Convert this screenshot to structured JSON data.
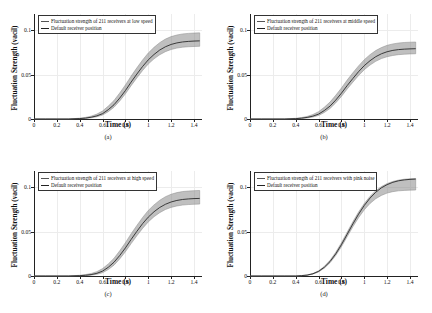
{
  "figure": {
    "panels": [
      {
        "id": "a",
        "caption": "(a)",
        "legend": [
          "Fluctuation strength of 211 receivers at low speed",
          "Default receiver position"
        ],
        "xlabel": "Time (s)",
        "ylabel": "Fluctuation Strength (vacil)"
      },
      {
        "id": "b",
        "caption": "(b)",
        "legend": [
          "Fluctuation strength of 211 receivers at middle speed",
          "Default receiver position"
        ],
        "xlabel": "Time (s)",
        "ylabel": "Fluctuation Strength (vacil)"
      },
      {
        "id": "c",
        "caption": "(c)",
        "legend": [
          "Fluctuation strength of 211 receivers at high speed",
          "Default receiver position"
        ],
        "xlabel": "Time (s)",
        "ylabel": "Fluctuation Strength (vacil)"
      },
      {
        "id": "d",
        "caption": "(d)",
        "legend": [
          "Fluctuation strength of 211 receivers with pink noise",
          "Default receiver position"
        ],
        "xlabel": "Time (s)",
        "ylabel": "Fluctuation Strength (vacil)"
      }
    ]
  },
  "chart_data": [
    {
      "type": "line",
      "panel": "a",
      "title": "",
      "xlabel": "Time (s)",
      "ylabel": "Fluctuation Strength (vacil)",
      "xlim": [
        0,
        1.47
      ],
      "ylim": [
        0,
        0.118
      ],
      "xticks": [
        0,
        0.2,
        0.4,
        0.6,
        0.8,
        1,
        1.2,
        1.4
      ],
      "xticklabels": [
        "0",
        "0.2",
        "0.4",
        "0.6",
        "0.8",
        "1",
        "1.2",
        "1.4"
      ],
      "yticks": [
        0,
        0.05,
        0.1
      ],
      "yticklabels": [
        "0",
        "0.05",
        "0.1"
      ],
      "grid": true,
      "legend_position": "upper-left",
      "x": [
        0,
        0.1,
        0.2,
        0.3,
        0.4,
        0.45,
        0.5,
        0.55,
        0.6,
        0.65,
        0.7,
        0.75,
        0.8,
        0.85,
        0.9,
        0.95,
        1.0,
        1.05,
        1.1,
        1.15,
        1.2,
        1.25,
        1.3,
        1.35,
        1.4,
        1.45
      ],
      "series": [
        {
          "name": "Default receiver position",
          "color": "#222222",
          "values": [
            0,
            0,
            0,
            0,
            0.0005,
            0.001,
            0.002,
            0.0035,
            0.006,
            0.0105,
            0.016,
            0.0235,
            0.032,
            0.0415,
            0.0505,
            0.059,
            0.0665,
            0.0725,
            0.0775,
            0.0812,
            0.0838,
            0.0855,
            0.0866,
            0.0872,
            0.0876,
            0.0878
          ]
        },
        {
          "name": "Fluctuation strength of 211 receivers at low speed (band upper)",
          "color": "#8a8a8a",
          "values": [
            0,
            0,
            0,
            0,
            0.0009,
            0.0018,
            0.0032,
            0.0055,
            0.009,
            0.0145,
            0.0208,
            0.0292,
            0.0383,
            0.0482,
            0.0575,
            0.0663,
            0.0742,
            0.0805,
            0.0858,
            0.0898,
            0.0926,
            0.0944,
            0.0956,
            0.0962,
            0.0966,
            0.0968
          ]
        },
        {
          "name": "Fluctuation strength of 211 receivers at low speed (band lower)",
          "color": "#8a8a8a",
          "values": [
            0,
            0,
            0,
            0,
            0.0003,
            0.0006,
            0.0013,
            0.0025,
            0.0045,
            0.0082,
            0.0132,
            0.0202,
            0.0283,
            0.0375,
            0.0462,
            0.0545,
            0.0618,
            0.0676,
            0.0722,
            0.0757,
            0.0781,
            0.0797,
            0.0807,
            0.0812,
            0.0815,
            0.0817
          ]
        }
      ]
    },
    {
      "type": "line",
      "panel": "b",
      "title": "",
      "xlabel": "Time (s)",
      "ylabel": "Fluctuation Strength (vacil)",
      "xlim": [
        0,
        1.47
      ],
      "ylim": [
        0,
        0.118
      ],
      "xticks": [
        0,
        0.2,
        0.4,
        0.6,
        0.8,
        1,
        1.2,
        1.4
      ],
      "xticklabels": [
        "0",
        "0.2",
        "0.4",
        "0.6",
        "0.8",
        "1",
        "1.2",
        "1.4"
      ],
      "yticks": [
        0,
        0.05,
        0.1
      ],
      "yticklabels": [
        "0",
        "0.05",
        "0.1"
      ],
      "grid": true,
      "legend_position": "upper-left",
      "x": [
        0,
        0.1,
        0.2,
        0.3,
        0.4,
        0.45,
        0.5,
        0.55,
        0.6,
        0.65,
        0.7,
        0.75,
        0.8,
        0.85,
        0.9,
        0.95,
        1.0,
        1.05,
        1.1,
        1.15,
        1.2,
        1.25,
        1.3,
        1.35,
        1.4,
        1.45
      ],
      "series": [
        {
          "name": "Default receiver position",
          "color": "#222222",
          "values": [
            0,
            0,
            0,
            0,
            0.0004,
            0.0009,
            0.0018,
            0.0032,
            0.0055,
            0.0095,
            0.0145,
            0.0212,
            0.029,
            0.0375,
            0.0455,
            0.0532,
            0.06,
            0.0655,
            0.07,
            0.0733,
            0.0756,
            0.0771,
            0.078,
            0.0785,
            0.0788,
            0.079
          ]
        },
        {
          "name": "Fluctuation strength of 211 receivers at middle speed (band upper)",
          "color": "#8a8a8a",
          "values": [
            0,
            0,
            0,
            0,
            0.0008,
            0.0016,
            0.0029,
            0.005,
            0.0082,
            0.0132,
            0.019,
            0.0266,
            0.0348,
            0.0437,
            0.0519,
            0.0597,
            0.0667,
            0.0723,
            0.0769,
            0.0803,
            0.0828,
            0.0844,
            0.0854,
            0.086,
            0.0863,
            0.0865
          ]
        },
        {
          "name": "Fluctuation strength of 211 receivers at middle speed (band lower)",
          "color": "#8a8a8a",
          "values": [
            0,
            0,
            0,
            0,
            0.0002,
            0.0005,
            0.0011,
            0.0022,
            0.004,
            0.0073,
            0.0118,
            0.0181,
            0.0254,
            0.0336,
            0.0414,
            0.0488,
            0.0554,
            0.0606,
            0.0648,
            0.0679,
            0.07,
            0.0714,
            0.0723,
            0.0728,
            0.0731,
            0.0733
          ]
        }
      ]
    },
    {
      "type": "line",
      "panel": "c",
      "title": "",
      "xlabel": "Time (s)",
      "ylabel": "Fluctuation Strength (vacil)",
      "xlim": [
        0,
        1.47
      ],
      "ylim": [
        0,
        0.118
      ],
      "xticks": [
        0,
        0.2,
        0.4,
        0.6,
        0.8,
        1,
        1.2,
        1.4
      ],
      "xticklabels": [
        "0",
        "0.2",
        "0.4",
        "0.6",
        "0.8",
        "1",
        "1.2",
        "1.4"
      ],
      "yticks": [
        0,
        0.05,
        0.1
      ],
      "yticklabels": [
        "0",
        "0.05",
        "0.1"
      ],
      "grid": true,
      "legend_position": "upper-left",
      "x": [
        0,
        0.1,
        0.2,
        0.3,
        0.4,
        0.45,
        0.5,
        0.55,
        0.6,
        0.65,
        0.7,
        0.75,
        0.8,
        0.85,
        0.9,
        0.95,
        1.0,
        1.05,
        1.1,
        1.15,
        1.2,
        1.25,
        1.3,
        1.35,
        1.4,
        1.45
      ],
      "series": [
        {
          "name": "Default receiver position",
          "color": "#222222",
          "values": [
            0,
            0,
            0,
            0,
            0.0004,
            0.0008,
            0.0016,
            0.003,
            0.0055,
            0.0098,
            0.0155,
            0.023,
            0.0316,
            0.0411,
            0.0502,
            0.0588,
            0.0662,
            0.0722,
            0.077,
            0.0806,
            0.0832,
            0.0849,
            0.086,
            0.0866,
            0.087,
            0.0872
          ]
        },
        {
          "name": "Fluctuation strength of 211 receivers at high speed (band upper)",
          "color": "#8a8a8a",
          "values": [
            0,
            0,
            0,
            0,
            0.0008,
            0.0016,
            0.0028,
            0.0049,
            0.0083,
            0.0136,
            0.0199,
            0.0283,
            0.0375,
            0.0475,
            0.0568,
            0.0657,
            0.0737,
            0.0799,
            0.0851,
            0.0891,
            0.0919,
            0.0937,
            0.0949,
            0.0955,
            0.0959,
            0.0961
          ]
        },
        {
          "name": "Fluctuation strength of 211 receivers at high speed (band lower)",
          "color": "#8a8a8a",
          "values": [
            0,
            0,
            0,
            0,
            0.0002,
            0.0004,
            0.0009,
            0.0019,
            0.0037,
            0.0072,
            0.0122,
            0.0192,
            0.0273,
            0.0364,
            0.0452,
            0.0535,
            0.0608,
            0.0666,
            0.0712,
            0.0747,
            0.0771,
            0.0787,
            0.0797,
            0.0803,
            0.0806,
            0.0808
          ]
        }
      ]
    },
    {
      "type": "line",
      "panel": "d",
      "title": "",
      "xlabel": "Time (s)",
      "ylabel": "Fluctuation Strength (vacil)",
      "xlim": [
        0,
        1.47
      ],
      "ylim": [
        0,
        0.118
      ],
      "xticks": [
        0,
        0.2,
        0.4,
        0.6,
        0.8,
        1,
        1.2,
        1.4
      ],
      "xticklabels": [
        "0",
        "0.2",
        "0.4",
        "0.6",
        "0.8",
        "1",
        "1.2",
        "1.4"
      ],
      "yticks": [
        0,
        0.05,
        0.1
      ],
      "yticklabels": [
        "0",
        "0.05",
        "0.1"
      ],
      "grid": true,
      "legend_position": "upper-left",
      "x": [
        0,
        0.1,
        0.2,
        0.3,
        0.4,
        0.45,
        0.5,
        0.55,
        0.6,
        0.65,
        0.7,
        0.75,
        0.8,
        0.85,
        0.9,
        0.95,
        1.0,
        1.05,
        1.1,
        1.15,
        1.2,
        1.25,
        1.3,
        1.35,
        1.4,
        1.45
      ],
      "series": [
        {
          "name": "Default receiver position",
          "color": "#222222",
          "values": [
            0,
            0,
            0,
            0,
            0,
            0.0004,
            0.001,
            0.0025,
            0.0052,
            0.0098,
            0.0162,
            0.0248,
            0.0352,
            0.0468,
            0.0585,
            0.0695,
            0.0793,
            0.0875,
            0.0941,
            0.0991,
            0.1027,
            0.1053,
            0.107,
            0.108,
            0.1086,
            0.1089
          ]
        },
        {
          "name": "Fluctuation strength of 211 receivers with pink noise (band upper)",
          "color": "#8a8a8a",
          "values": [
            0,
            0,
            0,
            0,
            0,
            0.0005,
            0.0012,
            0.0028,
            0.0058,
            0.0108,
            0.0176,
            0.0266,
            0.0374,
            0.0492,
            0.061,
            0.0719,
            0.0815,
            0.0895,
            0.0958,
            0.1005,
            0.1039,
            0.1063,
            0.1078,
            0.1088,
            0.1093,
            0.1096
          ]
        },
        {
          "name": "Fluctuation strength of 211 receivers with pink noise (band lower)",
          "color": "#8a8a8a",
          "values": [
            0,
            0,
            0,
            0,
            0,
            0.0003,
            0.0008,
            0.0021,
            0.0046,
            0.0088,
            0.0148,
            0.023,
            0.0329,
            0.0441,
            0.0553,
            0.0656,
            0.0744,
            0.0815,
            0.0868,
            0.0906,
            0.0932,
            0.0948,
            0.0957,
            0.0962,
            0.0965,
            0.0966
          ]
        }
      ]
    }
  ]
}
